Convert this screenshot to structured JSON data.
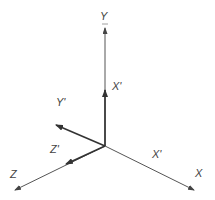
{
  "diagram": {
    "title": "",
    "origin": [
      105,
      146
    ],
    "axes": [
      {
        "name": "Y",
        "label": "Y",
        "end": [
          105,
          28
        ],
        "label_pos": [
          100,
          20
        ],
        "arrow": true
      },
      {
        "name": "Z",
        "label": "Z",
        "end": [
          15,
          190
        ],
        "label_pos": [
          10,
          178
        ],
        "arrow": true
      },
      {
        "name": "X",
        "label": "X",
        "end": [
          194,
          190
        ],
        "label_pos": [
          195,
          177
        ],
        "arrow": true
      }
    ],
    "vectors": [
      {
        "name": "X'",
        "label": "X'",
        "end": [
          105,
          90
        ],
        "label_pos": [
          112,
          90
        ]
      },
      {
        "name": "Y'",
        "label": "Y'",
        "end": [
          56,
          125
        ],
        "label_pos": [
          56,
          106
        ]
      },
      {
        "name": "Z'",
        "label": "Z'",
        "end": [
          66,
          164
        ],
        "label_pos": [
          50,
          153
        ]
      }
    ],
    "extra_labels": [
      {
        "name": "X'-on-X-axis",
        "label": "X'",
        "label_pos": [
          152,
          158
        ]
      }
    ],
    "colors": {
      "line": "#555555",
      "vector": "#333333",
      "text": "#444444",
      "background": "#ffffff"
    }
  }
}
